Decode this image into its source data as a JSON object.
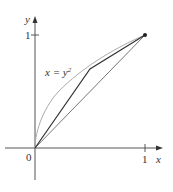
{
  "diagram": {
    "axes": {
      "x_label": "x",
      "y_label": "y",
      "origin_label": "0",
      "x_tick_label": "1",
      "y_tick_label": "1"
    },
    "curve_label": "x = y",
    "curve_label_exp": "2",
    "curve": "x = y^2",
    "polyline_points": [
      [
        0,
        0
      ],
      [
        0.5,
        0.707
      ],
      [
        1,
        1
      ]
    ],
    "chord": [
      [
        0,
        0
      ],
      [
        1,
        1
      ]
    ],
    "endpoint": [
      1,
      1
    ],
    "colors": {
      "axes": "#555555",
      "curve": "#aaaaaa",
      "polyline": "#333333",
      "chord": "#777777"
    }
  }
}
